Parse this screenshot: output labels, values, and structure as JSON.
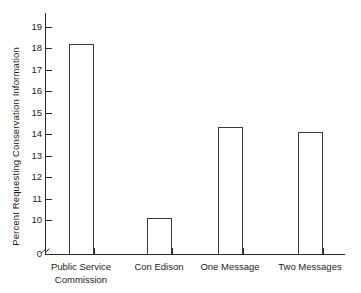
{
  "chart_data": {
    "type": "bar",
    "title": "",
    "xlabel": "",
    "ylabel": "Percent Requesting Conservation Information",
    "categories": [
      "Public Service\nCommission",
      "Con Edison",
      "One Message",
      "Two Messages"
    ],
    "values": [
      18.2,
      10.1,
      14.35,
      14.1
    ],
    "ylim": [
      0,
      19.6
    ],
    "y_ticks": [
      0,
      10,
      11,
      12,
      13,
      14,
      15,
      16,
      17,
      18,
      19
    ],
    "y_tick_labels": [
      "0",
      "10",
      "11",
      "12",
      "13",
      "14",
      "15",
      "16",
      "17",
      "18",
      "19"
    ],
    "axis_break": true,
    "axis_break_between": [
      0,
      10
    ],
    "grid": false,
    "legend": null,
    "bar_style": "outline",
    "bar_edge_color": "#3a3a3a",
    "bar_fill_color": "#ffffff",
    "axis_color": "#2a2a2a"
  },
  "labels": {
    "y_axis_title": "Percent Requesting Conservation Information",
    "cat_0": "Public Service\nCommission",
    "cat_1": "Con Edison",
    "cat_2": "One Message",
    "cat_3": "Two Messages",
    "tick_0": "0",
    "tick_10": "10",
    "tick_11": "11",
    "tick_12": "12",
    "tick_13": "13",
    "tick_14": "14",
    "tick_15": "15",
    "tick_16": "16",
    "tick_17": "17",
    "tick_18": "18",
    "tick_19": "19"
  }
}
